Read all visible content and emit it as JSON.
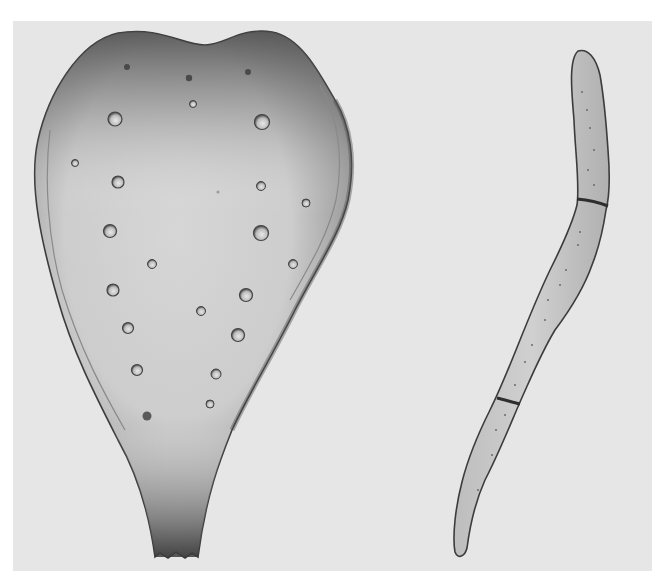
{
  "figure": {
    "colors": {
      "page": "#ffffff",
      "panel": "#e6e6e6",
      "body_fill": "#cfcfcf",
      "shade_dark": "#5a5a5a",
      "outline": "#3c3c3c"
    },
    "specimens": [
      {
        "id": "left",
        "shape": "flattened obovate / spathulate body with notched top and tapered truncate base",
        "pore_count": 26
      },
      {
        "id": "right",
        "shape": "elongate curved septate filament",
        "septa_count": 2
      }
    ]
  }
}
